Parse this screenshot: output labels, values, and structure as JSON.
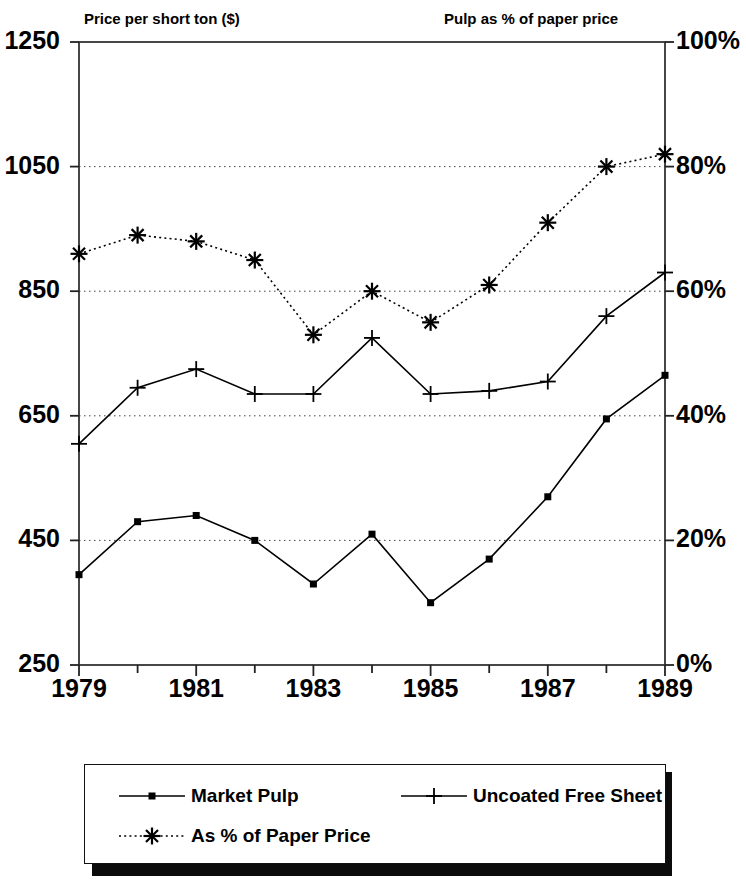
{
  "axes": {
    "left_title": "Price per short ton ($)",
    "right_title": "Pulp as % of paper price",
    "left_ticks": [
      "1250",
      "1050",
      "850",
      "650",
      "450",
      "250"
    ],
    "right_ticks": [
      "100%",
      "80%",
      "60%",
      "40%",
      "20%",
      "0%"
    ],
    "x_ticks": [
      "1979",
      "1981",
      "1983",
      "1985",
      "1987",
      "1989"
    ]
  },
  "legend": {
    "items": [
      {
        "label": "Market Pulp",
        "marker": "square-marker-icon",
        "style": "solid"
      },
      {
        "label": "Uncoated Free Sheet",
        "marker": "plus-marker-icon",
        "style": "solid"
      },
      {
        "label": "As % of Paper Price",
        "marker": "asterisk-marker-icon",
        "style": "dotted"
      }
    ]
  },
  "chart_data": {
    "type": "line",
    "title": "",
    "xlabel": "",
    "ylabel": "Price per short ton ($)",
    "y2label": "Pulp as % of paper price",
    "x": [
      1979,
      1980,
      1981,
      1982,
      1983,
      1984,
      1985,
      1986,
      1987,
      1988,
      1989
    ],
    "xlim": [
      1979,
      1989
    ],
    "ylim": [
      250,
      1250
    ],
    "y2lim": [
      0,
      100
    ],
    "ytick_values": [
      250,
      450,
      650,
      850,
      1050,
      1250
    ],
    "y2tick_values": [
      0,
      20,
      40,
      60,
      80,
      100
    ],
    "xtick_values": [
      1979,
      1981,
      1983,
      1985,
      1987,
      1989
    ],
    "xminor_ticks": [
      1980,
      1982,
      1984,
      1986,
      1988
    ],
    "grid": "horizontal-dotted",
    "legend_position": "below-plot",
    "series": [
      {
        "name": "Market Pulp",
        "axis": "left",
        "marker": "square",
        "line": "solid",
        "values": [
          395,
          480,
          490,
          450,
          380,
          460,
          350,
          420,
          520,
          645,
          715
        ]
      },
      {
        "name": "Uncoated Free Sheet",
        "axis": "left",
        "marker": "plus",
        "line": "solid",
        "values": [
          605,
          695,
          725,
          685,
          685,
          775,
          685,
          690,
          705,
          810,
          880
        ]
      },
      {
        "name": "As % of Paper Price",
        "axis": "right",
        "marker": "asterisk",
        "line": "dotted",
        "values": [
          66,
          69,
          68,
          65,
          53,
          60,
          55,
          61,
          71,
          80,
          82
        ]
      }
    ]
  }
}
